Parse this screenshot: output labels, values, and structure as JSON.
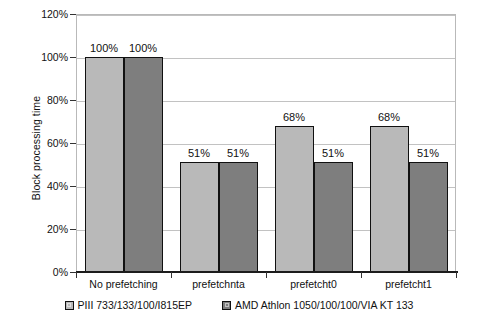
{
  "chart_data": {
    "type": "bar",
    "title": "",
    "xlabel": "",
    "ylabel": "Block processing time",
    "categories": [
      "No prefetching",
      "prefetchnta",
      "prefetcht0",
      "prefetcht1"
    ],
    "series": [
      {
        "name": "PIII 733/133/100/I815EP",
        "color": "#b9b9b9",
        "values": [
          100,
          51,
          68,
          68
        ],
        "labels": [
          "100%",
          "51%",
          "68%",
          "68%"
        ]
      },
      {
        "name": "AMD Athlon 1050/100/100/VIA KT 133",
        "color": "#7e7e7e",
        "values": [
          100,
          51,
          51,
          51
        ],
        "labels": [
          "100%",
          "51%",
          "51%",
          "51%"
        ]
      }
    ],
    "ylim": [
      0,
      120
    ],
    "ytick_values": [
      0,
      20,
      40,
      60,
      80,
      100,
      120
    ],
    "ytick_labels": [
      "0%",
      "20%",
      "40%",
      "60%",
      "80%",
      "100%",
      "120%"
    ],
    "grid": true,
    "legend_position": "bottom",
    "value_suffix": "%"
  }
}
